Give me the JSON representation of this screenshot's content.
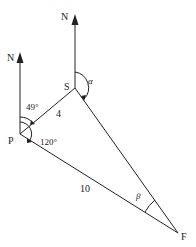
{
  "diagram": {
    "points": {
      "P": {
        "label": "P"
      },
      "S": {
        "label": "S"
      },
      "F": {
        "label": "F"
      }
    },
    "north_labels": {
      "at_P": "N",
      "at_S": "N"
    },
    "edges": {
      "PS": {
        "length_label": "4"
      },
      "PF": {
        "length_label": "10"
      },
      "SF": {
        "length_label": ""
      }
    },
    "angles": {
      "north_to_PS_at_P": "49°",
      "north_to_PF_at_P": "120°",
      "north_to_SF_at_S": "α",
      "at_F": "β"
    },
    "colors": {
      "line": "#222222",
      "background": "#ffffff"
    }
  }
}
